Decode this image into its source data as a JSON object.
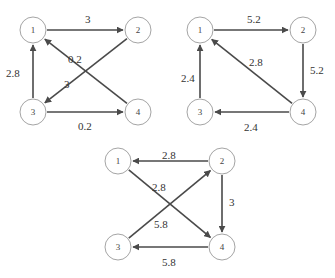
{
  "graphs": [
    {
      "id": "A",
      "nodes": [
        {
          "label": "1",
          "x": 33,
          "y": 30
        },
        {
          "label": "2",
          "x": 138,
          "y": 30
        },
        {
          "label": "3",
          "x": 33,
          "y": 112
        },
        {
          "label": "4",
          "x": 138,
          "y": 112
        }
      ],
      "edges": [
        {
          "from": "1",
          "to": "2",
          "weight": "3",
          "lx": 85,
          "ly": 23
        },
        {
          "from": "2",
          "to": "3",
          "weight": "3",
          "lx": 64,
          "ly": 88
        },
        {
          "from": "3",
          "to": "1",
          "weight": "2.8",
          "lx": 6,
          "ly": 77
        },
        {
          "from": "4",
          "to": "1",
          "weight": "0.2",
          "lx": 68,
          "ly": 63
        },
        {
          "from": "3",
          "to": "4",
          "weight": "0.2",
          "lx": 78,
          "ly": 130
        }
      ]
    },
    {
      "id": "B",
      "nodes": [
        {
          "label": "1",
          "x": 200,
          "y": 30
        },
        {
          "label": "2",
          "x": 303,
          "y": 30
        },
        {
          "label": "3",
          "x": 200,
          "y": 112
        },
        {
          "label": "4",
          "x": 303,
          "y": 112
        }
      ],
      "edges": [
        {
          "from": "1",
          "to": "2",
          "weight": "5.2",
          "lx": 247,
          "ly": 23
        },
        {
          "from": "2",
          "to": "4",
          "weight": "5.2",
          "lx": 310,
          "ly": 74
        },
        {
          "from": "4",
          "to": "1",
          "weight": "2.8",
          "lx": 249,
          "ly": 66
        },
        {
          "from": "3",
          "to": "1",
          "weight": "2.4",
          "lx": 181,
          "ly": 82
        },
        {
          "from": "4",
          "to": "3",
          "weight": "2.4",
          "lx": 244,
          "ly": 131
        }
      ]
    },
    {
      "id": "C",
      "nodes": [
        {
          "label": "1",
          "x": 118,
          "y": 161
        },
        {
          "label": "2",
          "x": 222,
          "y": 161
        },
        {
          "label": "3",
          "x": 118,
          "y": 247
        },
        {
          "label": "4",
          "x": 222,
          "y": 247
        }
      ],
      "edges": [
        {
          "from": "2",
          "to": "1",
          "weight": "2.8",
          "lx": 162,
          "ly": 159
        },
        {
          "from": "1",
          "to": "4",
          "weight": "2.8",
          "lx": 152,
          "ly": 191
        },
        {
          "from": "2",
          "to": "4",
          "weight": "3",
          "lx": 229,
          "ly": 206
        },
        {
          "from": "3",
          "to": "2",
          "weight": "5.8",
          "lx": 154,
          "ly": 228
        },
        {
          "from": "4",
          "to": "3",
          "weight": "5.8",
          "lx": 162,
          "ly": 266
        }
      ]
    }
  ],
  "style": {
    "edge_color": "#4a4a4a",
    "node_stroke": "#9a9a9a",
    "node_radius": 13
  }
}
